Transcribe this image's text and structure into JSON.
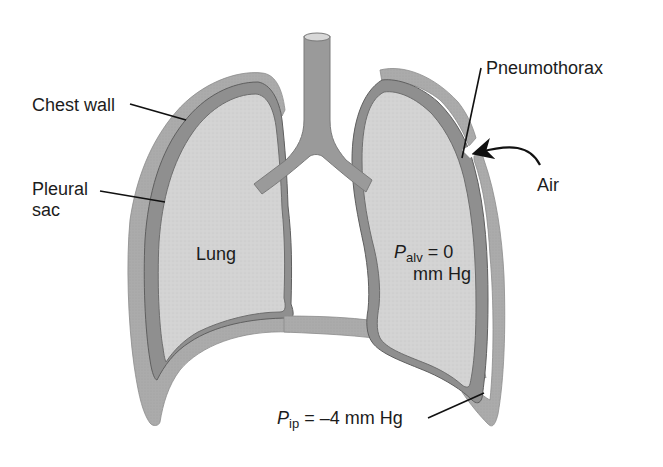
{
  "figure": {
    "type": "anatomical-diagram"
  },
  "colors": {
    "background": "#ffffff",
    "chest_wall": "#a9a9a9",
    "pleural_sac": "#8f8f8f",
    "lung_tissue": "#d2d2d2",
    "airway": "#9a9a9a",
    "outline": "#6e6e6e",
    "label_text": "#1c1c1c",
    "leader_line": "#111111"
  },
  "labels": {
    "chest_wall": "Chest wall",
    "pleural_sac_line1": "Pleural",
    "pleural_sac_line2": "sac",
    "lung": "Lung",
    "pneumothorax": "Pneumothorax",
    "air": "Air",
    "p_alv_symbol": "P",
    "p_alv_subscript": "alv",
    "p_alv_value": " = 0",
    "p_alv_unit": "mm Hg",
    "p_ip_symbol": "P",
    "p_ip_subscript": "ip",
    "p_ip_value": " = –4 mm Hg"
  },
  "annotations": [
    {
      "label": "Chest wall",
      "points_to": "outer wall, left side"
    },
    {
      "label": "Pleural sac",
      "points_to": "pleural layer, left side"
    },
    {
      "label": "Pneumothorax",
      "points_to": "gap in chest wall, right side"
    },
    {
      "label": "Air",
      "points_to": "air entering through opening (curved arrow)"
    },
    {
      "label": "Palv = 0 mm Hg",
      "points_to": "right lung alveolar pressure"
    },
    {
      "label": "Pip = -4 mm Hg",
      "points_to": "intrapleural space, lower right"
    }
  ]
}
